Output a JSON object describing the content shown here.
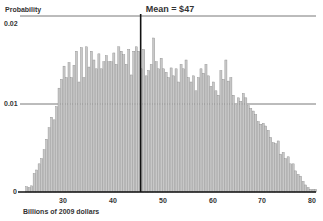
{
  "chart_data": {
    "type": "bar",
    "title": "",
    "ylabel": "Probability",
    "xlabel": "Billions of 2009 dollars",
    "xlim": [
      22,
      81
    ],
    "ylim": [
      0,
      0.021
    ],
    "xticks": [
      30,
      40,
      50,
      60,
      70,
      80
    ],
    "xtick_labels": [
      "30",
      "40",
      "50",
      "60",
      "70",
      "80"
    ],
    "yticks": [
      0,
      0.01,
      0.02
    ],
    "ytick_labels": [
      "0",
      "0.01",
      "0.02"
    ],
    "grid": {
      "horizontal": true,
      "vertical": false,
      "lines_at": [
        0.01,
        0.02
      ]
    },
    "legend": null,
    "bin_width": 0.5,
    "bin_start": 22.5,
    "values": [
      0.0006,
      0.0005,
      0.0007,
      0.0021,
      0.0025,
      0.0032,
      0.0038,
      0.0048,
      0.006,
      0.0073,
      0.0085,
      0.0082,
      0.0097,
      0.0118,
      0.0128,
      0.0143,
      0.013,
      0.0147,
      0.013,
      0.0144,
      0.016,
      0.0125,
      0.0164,
      0.013,
      0.0165,
      0.0142,
      0.016,
      0.015,
      0.014,
      0.0157,
      0.014,
      0.0148,
      0.0155,
      0.0148,
      0.0148,
      0.0158,
      0.0145,
      0.0165,
      0.016,
      0.0156,
      0.0145,
      0.0162,
      0.0133,
      0.016,
      0.0165,
      0.016,
      0.014,
      0.0162,
      0.0132,
      0.0138,
      0.0145,
      0.0175,
      0.0148,
      0.014,
      0.0152,
      0.014,
      0.0136,
      0.013,
      0.0141,
      0.0132,
      0.014,
      0.0125,
      0.0145,
      0.014,
      0.015,
      0.013,
      0.0125,
      0.0132,
      0.0115,
      0.013,
      0.014,
      0.0135,
      0.0145,
      0.0132,
      0.012,
      0.0125,
      0.0115,
      0.011,
      0.0138,
      0.0128,
      0.015,
      0.0126,
      0.013,
      0.011,
      0.0098,
      0.0107,
      0.0103,
      0.0112,
      0.0107,
      0.0098,
      0.0095,
      0.0092,
      0.0088,
      0.008,
      0.0077,
      0.0078,
      0.0075,
      0.007,
      0.0062,
      0.0056,
      0.0055,
      0.0058,
      0.0043,
      0.0045,
      0.0038,
      0.004,
      0.0032,
      0.0032,
      0.0024,
      0.002,
      0.0018,
      0.0012,
      0.0008,
      0.0005,
      0.0003,
      0.0003,
      0.0003
    ],
    "annotations": [
      {
        "type": "vline",
        "x": 47,
        "label": "Mean = $47"
      }
    ]
  },
  "labels": {
    "y_title": "Probability",
    "x_title": "Billions of 2009 dollars",
    "mean": "Mean = $47",
    "yticks": [
      "0",
      "0.01",
      "0.02"
    ],
    "xticks": [
      "30",
      "40",
      "50",
      "60",
      "70",
      "80"
    ]
  },
  "colors": {
    "bar_fill": "#c8c8c8",
    "bar_stroke": "#8a8a8a",
    "axis": "#111111",
    "gridline": "#555555",
    "mean_line": "#111111"
  }
}
